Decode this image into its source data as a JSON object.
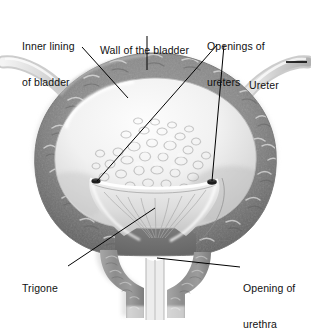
{
  "figure": {
    "style": "grayscale-airbrush-medical-illustration",
    "background": "#ffffff",
    "width": 311,
    "height": 325
  },
  "palette": {
    "background": "#ffffff",
    "wall_muscle_mid": "#8a8a8a",
    "wall_muscle_dark": "#6b6b6b",
    "wall_muscle_light": "#b4b4b4",
    "lining_light": "#f0f0f0",
    "lining_shadow": "#d2d2d2",
    "trigone": "#e2e2e2",
    "orifice_dark": "#1c1c1c",
    "leader_line": "#000000",
    "text": "#111111",
    "ureter_tube": "#d8d8d8"
  },
  "labels": [
    {
      "id": "inner-lining-of-bladder",
      "line1": "Inner lining",
      "line2": "of bladder",
      "x": 22,
      "y": 22
    },
    {
      "id": "wall-of-the-bladder",
      "line1": "Wall of the bladder",
      "line2": "",
      "x": 100,
      "y": 21
    },
    {
      "id": "openings-of-ureters",
      "line1": "Openings of",
      "line2": "ureters",
      "x": 207,
      "y": 20
    },
    {
      "id": "ureter",
      "line1": "Ureter",
      "line2": "",
      "x": 249,
      "y": 56
    },
    {
      "id": "trigone",
      "line1": "Trigone",
      "line2": "",
      "x": 22,
      "y": 259
    },
    {
      "id": "opening-of-urethra",
      "line1": "Opening of",
      "line2": "urethra",
      "x": 243,
      "y": 261
    }
  ],
  "leaders": [
    {
      "id": "leader-inner-lining",
      "from": [
        82,
        47
      ],
      "to": [
        128,
        98
      ]
    },
    {
      "id": "leader-wall",
      "from": [
        147,
        36
      ],
      "to": [
        147,
        70
      ]
    },
    {
      "id": "leader-openings-left",
      "from": [
        217,
        45
      ],
      "to": [
        97,
        181
      ]
    },
    {
      "id": "leader-openings-right",
      "from": [
        224,
        45
      ],
      "to": [
        212,
        181
      ]
    },
    {
      "id": "leader-ureter",
      "from": [
        287,
        62
      ],
      "to": [
        307,
        62
      ]
    },
    {
      "id": "leader-trigone",
      "from": [
        68,
        266
      ],
      "to": [
        155,
        208
      ]
    },
    {
      "id": "leader-opening-urethra",
      "from": [
        240,
        267
      ],
      "to": [
        157,
        258
      ]
    }
  ],
  "structures": [
    {
      "id": "bladder-wall",
      "name": "Wall of the bladder",
      "shape": "thick-oval-ring"
    },
    {
      "id": "bladder-lining",
      "name": "Inner lining of bladder",
      "shape": "inner-oval-cavity"
    },
    {
      "id": "rugae",
      "name": "mucosal folds",
      "count": 34
    },
    {
      "id": "ureteric-orifice-left",
      "name": "Opening of ureter (left)",
      "x": 96,
      "y": 181
    },
    {
      "id": "ureteric-orifice-right",
      "name": "Opening of ureter (right)",
      "x": 212,
      "y": 182
    },
    {
      "id": "trigone-region",
      "name": "Trigone",
      "shape": "smooth-triangle"
    },
    {
      "id": "ureter-tube-left",
      "name": "Ureter (left)",
      "entry": "upper-left"
    },
    {
      "id": "ureter-tube-right",
      "name": "Ureter (right)",
      "entry": "upper-right"
    },
    {
      "id": "urethra",
      "name": "Opening of urethra",
      "shape": "vertical-neck-channel"
    }
  ]
}
